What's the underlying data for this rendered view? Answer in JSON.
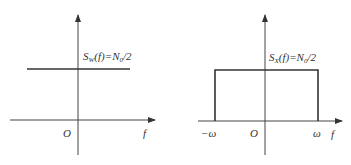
{
  "left_plot": {
    "name": "white-noise-psd",
    "label_main": "S",
    "label_sub": "W",
    "label_rest": "(f)=N",
    "label_sub2": "0",
    "label_end": "/2",
    "origin": "O",
    "x_axis_label": "f"
  },
  "right_plot": {
    "name": "bandlimited-noise-psd",
    "label_main": "S",
    "label_sub": "X",
    "label_rest": "(f)=N",
    "label_sub2": "0",
    "label_end": "/2",
    "origin": "O",
    "x_axis_label": "f",
    "neg_band": "−ω",
    "pos_band": "ω"
  }
}
